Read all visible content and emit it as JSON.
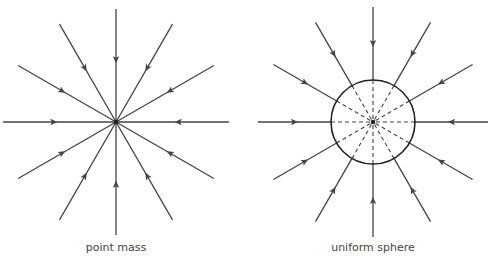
{
  "diagrams": [
    {
      "id": "point-mass",
      "label": "point mass",
      "center": [
        116,
        122
      ],
      "length": 113,
      "sphere_radius": 0
    },
    {
      "id": "uniform-sphere",
      "label": "uniform sphere",
      "center": [
        373,
        122
      ],
      "length": 115,
      "sphere_radius": 42
    }
  ],
  "field_line_angles_deg": [
    0,
    30,
    60,
    90,
    120,
    150,
    180,
    210,
    240,
    270,
    300,
    330
  ],
  "colors": {
    "line": "#444444",
    "sphere": "#222222"
  }
}
